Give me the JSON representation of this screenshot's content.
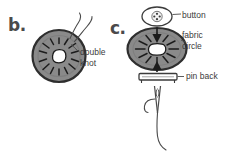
{
  "figure": {
    "type": "line-drawing-instruction-diagram",
    "background_color": "#ffffff",
    "ink_color": "#3b3b3b",
    "fill_gray": "#8a8a8a",
    "highlight_white": "#ffffff"
  },
  "panels": [
    {
      "id": "b",
      "label": "b.",
      "subject": "fabric circle gathered with thread forming a puff, seen from the back",
      "callouts": [
        {
          "id": "double-knot",
          "text": "double\nknot"
        }
      ]
    },
    {
      "id": "c",
      "label": "c.",
      "subject": "assembly diagram showing button, fabric circle and pin back with needle and thread",
      "callouts": [
        {
          "id": "button",
          "text": "button"
        },
        {
          "id": "fabric-circle",
          "text": "fabric\ncircle"
        },
        {
          "id": "pin-back",
          "text": "pin back"
        }
      ]
    }
  ]
}
